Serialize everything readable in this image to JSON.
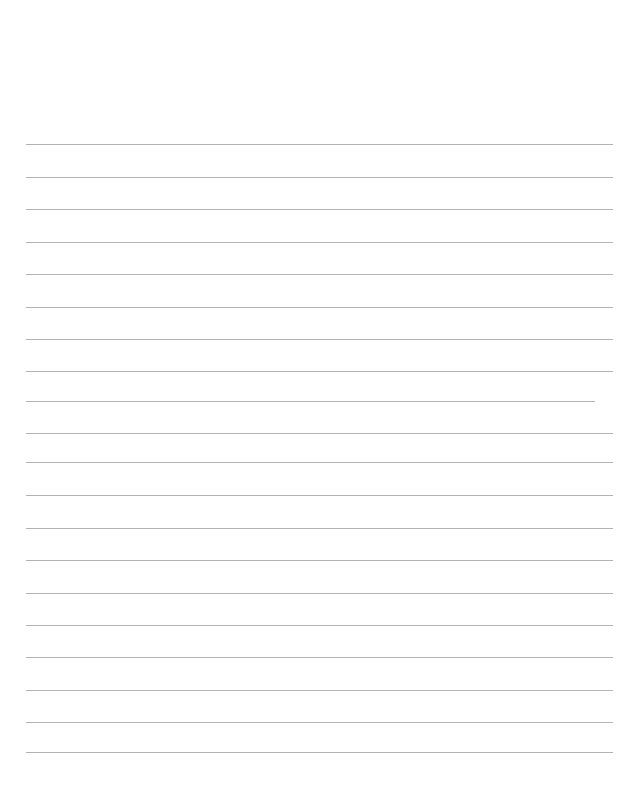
{
  "page": {
    "name": "lined-paper-sheet",
    "width": 641,
    "height": 793,
    "background_color": "#ffffff",
    "orientation": "portrait",
    "content_text": "",
    "top_margin_px": 144,
    "bottom_margin_px": 40,
    "left_margin_px": 26,
    "right_margin_px": 28
  },
  "ruling": {
    "line_color": "#b3b3b3",
    "line_thickness_px": 1,
    "line_spacing_px": 32.5,
    "line_count": 19,
    "default_left_px": 26,
    "default_right_px": 613,
    "lines": [
      {
        "index": 1,
        "y": 144,
        "left": 26,
        "right": 613,
        "text": ""
      },
      {
        "index": 2,
        "y": 177,
        "left": 26,
        "right": 613,
        "text": ""
      },
      {
        "index": 3,
        "y": 209,
        "left": 26,
        "right": 613,
        "text": ""
      },
      {
        "index": 4,
        "y": 242,
        "left": 26,
        "right": 613,
        "text": ""
      },
      {
        "index": 5,
        "y": 274,
        "left": 26,
        "right": 613,
        "text": ""
      },
      {
        "index": 6,
        "y": 307,
        "left": 26,
        "right": 613,
        "text": ""
      },
      {
        "index": 7,
        "y": 339,
        "left": 26,
        "right": 613,
        "text": ""
      },
      {
        "index": 8,
        "y": 371,
        "left": 26,
        "right": 613,
        "text": ""
      },
      {
        "index": 9,
        "y": 401,
        "left": 26,
        "right": 595,
        "text": ""
      },
      {
        "index": 10,
        "y": 433,
        "left": 26,
        "right": 613,
        "text": ""
      },
      {
        "index": 11,
        "y": 462,
        "left": 26,
        "right": 613,
        "text": ""
      },
      {
        "index": 12,
        "y": 495,
        "left": 26,
        "right": 613,
        "text": ""
      },
      {
        "index": 13,
        "y": 528,
        "left": 26,
        "right": 613,
        "text": ""
      },
      {
        "index": 14,
        "y": 560,
        "left": 26,
        "right": 613,
        "text": ""
      },
      {
        "index": 15,
        "y": 593,
        "left": 26,
        "right": 613,
        "text": ""
      },
      {
        "index": 16,
        "y": 625,
        "left": 26,
        "right": 613,
        "text": ""
      },
      {
        "index": 17,
        "y": 657,
        "left": 26,
        "right": 613,
        "text": ""
      },
      {
        "index": 18,
        "y": 690,
        "left": 26,
        "right": 613,
        "text": ""
      },
      {
        "index": 19,
        "y": 722,
        "left": 26,
        "right": 613,
        "text": ""
      },
      {
        "index": 20,
        "y": 752,
        "left": 26,
        "right": 613,
        "text": ""
      }
    ]
  }
}
